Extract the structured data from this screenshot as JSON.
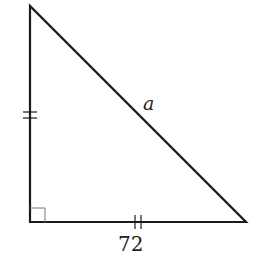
{
  "diagram": {
    "type": "right-triangle",
    "labels": {
      "hypotenuse": "a",
      "bottom_leg": "72"
    },
    "markers": {
      "left_leg_ticks": 2,
      "bottom_leg_ticks": 2,
      "right_angle": "bottom-left"
    },
    "colors": {
      "stroke": "#1a1a1a",
      "right_angle_box": "#777777",
      "background": "#ffffff"
    }
  }
}
